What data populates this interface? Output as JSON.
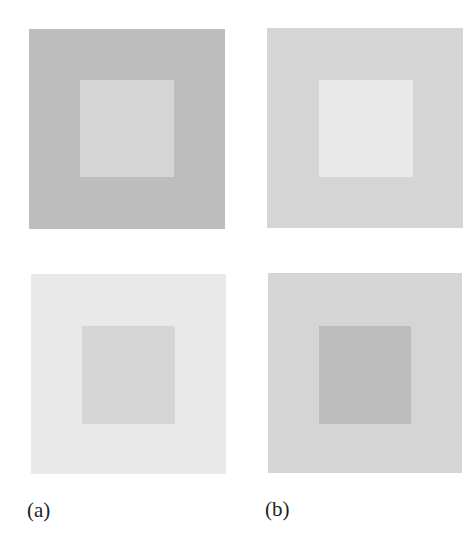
{
  "figure": {
    "panels": [
      {
        "id": "a-top",
        "column": "a",
        "row": "top",
        "outer_color": "#bdbdbd",
        "inner_color": "#d5d5d5"
      },
      {
        "id": "b-top",
        "column": "b",
        "row": "top",
        "outer_color": "#d5d5d5",
        "inner_color": "#e9e9e9"
      },
      {
        "id": "a-bottom",
        "column": "a",
        "row": "bottom",
        "outer_color": "#e9e9e9",
        "inner_color": "#d5d5d5"
      },
      {
        "id": "b-bottom",
        "column": "b",
        "row": "bottom",
        "outer_color": "#d5d5d5",
        "inner_color": "#bdbdbd"
      }
    ],
    "labels": {
      "a": "(a)",
      "b": "(b)"
    }
  }
}
